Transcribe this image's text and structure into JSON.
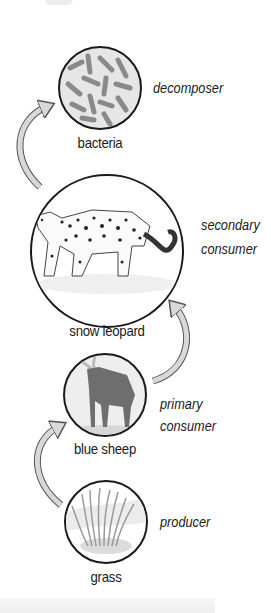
{
  "diagram": {
    "type": "food-chain",
    "direction": "bottom-to-top",
    "nodes": [
      {
        "id": "bacteria",
        "label": "bacteria",
        "role": "decomposer",
        "icon": "bacteria-illustration"
      },
      {
        "id": "snow-leopard",
        "label": "snow leopard",
        "role_lines": [
          "secondary",
          "consumer"
        ],
        "icon": "snow-leopard-illustration"
      },
      {
        "id": "blue-sheep",
        "label": "blue sheep",
        "role_lines": [
          "primary",
          "consumer"
        ],
        "icon": "blue-sheep-illustration"
      },
      {
        "id": "grass",
        "label": "grass",
        "role": "producer",
        "icon": "grass-illustration"
      }
    ],
    "arrows": [
      {
        "from": "grass",
        "to": "blue-sheep"
      },
      {
        "from": "blue-sheep",
        "to": "snow-leopard"
      },
      {
        "from": "snow-leopard",
        "to": "bacteria"
      }
    ],
    "colors": {
      "outline": "#1a1a1a",
      "arrow_fill": "#d8d8d8",
      "arrow_stroke": "#555555",
      "background": "#ffffff"
    }
  }
}
